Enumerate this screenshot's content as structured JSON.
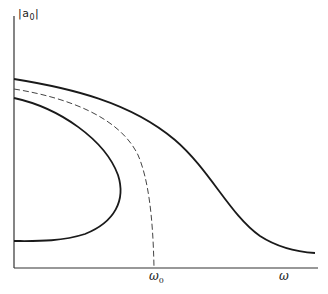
{
  "figure": {
    "y_axis_label": "|a",
    "y_axis_label_sub": "0",
    "y_axis_label_end": "|",
    "x_axis_label": "ω",
    "x_tick_label": "ω",
    "x_tick_label_sub": "0"
  },
  "colors": {
    "line": "#1a1a1a",
    "dashed": "#444444",
    "axis": "#333333"
  },
  "curves": [
    {
      "name": "outer-solid-curve",
      "style": "solid",
      "description": "monotonic decreasing curve from high left to low right"
    },
    {
      "name": "middle-dashed-curve",
      "style": "dashed",
      "description": "curve descending to vertical asymptote at ω0"
    },
    {
      "name": "inner-solid-curve",
      "style": "solid",
      "description": "bent-back (folded) curve with turning point left of ω0"
    }
  ]
}
